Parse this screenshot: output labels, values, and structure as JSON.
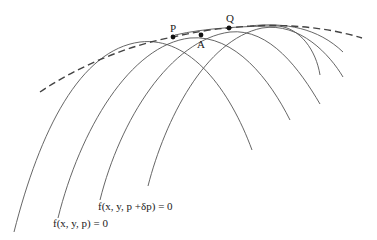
{
  "figure": {
    "points": [
      {
        "label": "P",
        "x": 173,
        "y": 37
      },
      {
        "label": "A",
        "x": 201,
        "y": 35
      },
      {
        "label": "Q",
        "x": 229,
        "y": 28
      }
    ],
    "equations": {
      "curve_p": "f(x, y,  p) = 0",
      "curve_p_dp": "f(x, y, p +δp) = 0"
    },
    "envelope_style": "dashed",
    "colors": {
      "curves": "#555555",
      "envelope": "#444444",
      "points": "#111111",
      "background": "#ffffff"
    }
  }
}
